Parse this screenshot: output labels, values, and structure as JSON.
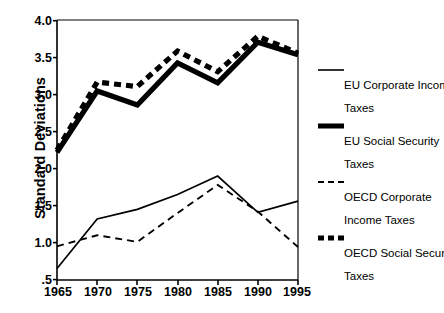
{
  "chart_data": {
    "type": "line",
    "title": "",
    "subtitle": "",
    "xlabel": "",
    "ylabel": "Standard Deviations",
    "x": [
      1965,
      1970,
      1975,
      1980,
      1985,
      1990,
      1995
    ],
    "xtick_labels": [
      "1965",
      "1970",
      "1975",
      "1980",
      "1985",
      "1990",
      "1995"
    ],
    "ytick_labels": [
      "4.0",
      "3.5",
      "3.0",
      "2.5",
      "2.0",
      "1.5",
      "1.0",
      ".5"
    ],
    "ytick_values": [
      4.0,
      3.5,
      3.0,
      2.5,
      2.0,
      1.5,
      1.0,
      0.5
    ],
    "xlim": [
      1965,
      1995
    ],
    "ylim": [
      0.5,
      4.0
    ],
    "grid": false,
    "legend_position": "right",
    "series": [
      {
        "name": "EU Corporate Income Taxes",
        "style": "thin-solid",
        "color": "#000000",
        "values": [
          0.65,
          1.32,
          1.45,
          1.65,
          1.9,
          1.41,
          1.56
        ]
      },
      {
        "name": "EU Social Security Taxes",
        "style": "thick-solid",
        "color": "#000000",
        "values": [
          2.22,
          3.05,
          2.86,
          3.43,
          3.16,
          3.71,
          3.54
        ]
      },
      {
        "name": "OECD Corporate Income Taxes",
        "style": "thin-dashed",
        "color": "#000000",
        "values": [
          0.95,
          1.1,
          1.01,
          1.4,
          1.78,
          1.42,
          0.94
        ]
      },
      {
        "name": "OECD Social Security Taxes",
        "style": "thick-dashed",
        "color": "#000000",
        "values": [
          2.25,
          3.17,
          3.11,
          3.59,
          3.31,
          3.79,
          3.56
        ]
      }
    ]
  },
  "axis": {
    "y_title": "Standard Deviations",
    "y_ticks": [
      {
        "label": "4.0"
      },
      {
        "label": "3.5"
      },
      {
        "label": "3.0"
      },
      {
        "label": "2.5"
      },
      {
        "label": "2.0"
      },
      {
        "label": "1.5"
      },
      {
        "label": "1.0"
      },
      {
        "label": ".5"
      }
    ],
    "x_ticks": [
      {
        "label": "1965"
      },
      {
        "label": "1970"
      },
      {
        "label": "1975"
      },
      {
        "label": "1980"
      },
      {
        "label": "1985"
      },
      {
        "label": "1990"
      },
      {
        "label": "1995"
      }
    ]
  },
  "legend": {
    "entries": [
      {
        "line1": "EU Corporate Income",
        "line2": "Taxes",
        "swatch": "thin-solid-line-swatch"
      },
      {
        "line1": "EU Social Security",
        "line2": "Taxes",
        "swatch": "thick-solid-line-swatch"
      },
      {
        "line1": "OECD Corporate",
        "line2": "Income Taxes",
        "swatch": "thin-dashed-line-swatch"
      },
      {
        "line1": "OECD Social Security",
        "line2": "Taxes",
        "swatch": "thick-dashed-line-swatch"
      }
    ]
  },
  "colors": {
    "ink": "#000000",
    "background": "#ffffff",
    "axis": "#000000"
  }
}
